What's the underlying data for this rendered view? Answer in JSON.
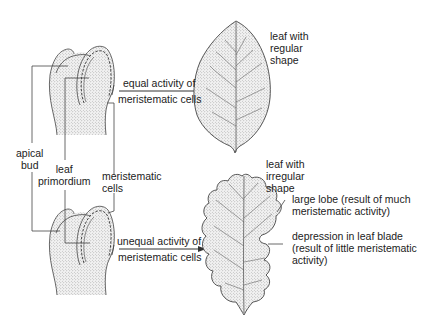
{
  "diagram": {
    "type": "biology-illustration",
    "colors": {
      "line": "#3a3a3a",
      "stipple": "#9a9a9a",
      "background": "#ffffff",
      "text": "#222222"
    },
    "top_panel": {
      "arrow_label_line1": "equal activity of",
      "arrow_label_line2": "meristematic cells",
      "result_label_line1": "leaf with",
      "result_label_line2": "regular",
      "result_label_line3": "shape"
    },
    "shared_labels": {
      "apical_bud_line1": "apical",
      "apical_bud_line2": "bud",
      "leaf_primordium_line1": "leaf",
      "leaf_primordium_line2": "primordium",
      "meristematic_cells_line1": "meristematic",
      "meristematic_cells_line2": "cells"
    },
    "bottom_panel": {
      "arrow_label_line1": "unequal activity of",
      "arrow_label_line2": "meristematic cells",
      "result_label_line1": "leaf with",
      "result_label_line2": "irregular",
      "result_label_line3": "shape",
      "lobe_label_line1": "large lobe (result of much",
      "lobe_label_line2": "meristematic activity)",
      "depression_label_line1": "depression in leaf blade",
      "depression_label_line2": "(result of little meristematic",
      "depression_label_line3": "activity)"
    }
  }
}
